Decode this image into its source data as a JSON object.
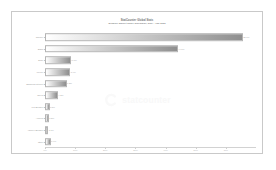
{
  "chart_data": {
    "type": "bar",
    "orientation": "horizontal",
    "title": "StatCounter Global Stats",
    "subtitle": "Browser Market Share Worldwide, 2024 - Jan 2025",
    "xlabel": "",
    "ylabel": "",
    "xlim": [
      0,
      70
    ],
    "grid": false,
    "legend": "none",
    "categories": [
      "Chrome",
      "Safari",
      "Edge",
      "Firefox",
      "Samsung Internet",
      "Opera",
      "UC Browser",
      "Android",
      "Yandex Browser",
      "Other"
    ],
    "values": [
      65.6,
      44.1,
      8.7,
      8.4,
      7.2,
      4.3,
      1.5,
      1.3,
      1.1,
      1.9
    ],
    "value_labels": [
      "65.6%",
      "44.1%",
      "8.7%",
      "8.4%",
      "7.2%",
      "4.3%",
      "1.5%",
      "1.3%",
      "1.1%",
      "1.9%"
    ],
    "xticks": [
      0,
      10,
      20,
      30,
      40,
      50,
      60
    ],
    "xtick_labels": [
      "0%",
      "10%",
      "20%",
      "30%",
      "40%",
      "50%",
      "60%"
    ],
    "bar_gradient_start": "#ffffff",
    "bar_gradient_end": "#8f8f8f",
    "bar_border_color": "#b4b4b4"
  },
  "watermark": {
    "text": "statcounter",
    "logo_name": "statcounter-c-logo",
    "color": "#f2f2f2"
  },
  "frame": {
    "border_color": "#c9c9c9",
    "background": "#ffffff"
  }
}
